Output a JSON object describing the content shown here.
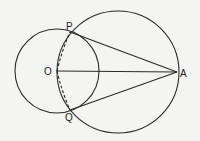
{
  "diagram": {
    "type": "geometry",
    "points": {
      "O": {
        "label": "O",
        "x": 57,
        "y": 71
      },
      "P": {
        "label": "P",
        "x": 70,
        "y": 32
      },
      "Q": {
        "label": "Q",
        "x": 70,
        "y": 110
      },
      "A": {
        "label": "A",
        "x": 177,
        "y": 72
      }
    },
    "circles": [
      {
        "name": "small-circle",
        "cx": 57,
        "cy": 71,
        "r": 42
      },
      {
        "name": "large-circle",
        "cx": 118,
        "cy": 72,
        "r": 61
      }
    ],
    "segments": [
      {
        "name": "segment-PA",
        "from": "P",
        "to": "A",
        "style": "solid"
      },
      {
        "name": "segment-OA",
        "from": "O",
        "to": "A",
        "style": "solid"
      },
      {
        "name": "segment-QA",
        "from": "Q",
        "to": "A",
        "style": "solid"
      },
      {
        "name": "segment-OP",
        "from": "O",
        "to": "P",
        "style": "dashed"
      },
      {
        "name": "segment-OQ",
        "from": "O",
        "to": "Q",
        "style": "dashed"
      }
    ],
    "colors": {
      "stroke": "#2a2a2a",
      "background": "#f4f4f2"
    }
  }
}
